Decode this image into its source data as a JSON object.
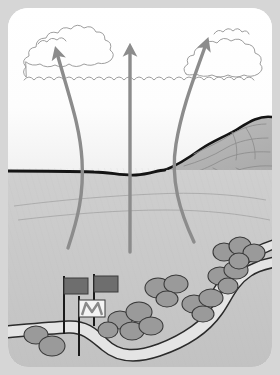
{
  "illustration": {
    "title": "Valley updraft and ridge landscape diagram",
    "frame": {
      "outer_background": "#d6d6d6",
      "frame_fill": "#ffffff",
      "corner_radius_px": 20
    },
    "palette": {
      "sky": "#fbfbfb",
      "sky_low": "#f0f0f0",
      "ground": "#c9c9c9",
      "ground_dark": "#bdbdbd",
      "mountain": "#b6b6b6",
      "mountain_shadow": "#a9a9a9",
      "horizon_line": "#1a1a1a",
      "arrow": "#8c8c8c",
      "cloud_outline": "#9a9a9a",
      "bush_fill": "#9a9a9a",
      "bush_outline": "#3a3a3a",
      "river_fill": "#e2e2e2",
      "river_outline": "#2b2b2b",
      "flag_dark": "#6e6e6e",
      "flag_white": "#f2f2f2",
      "pole": "#1a1a1a",
      "contour_line": "#8e8e8e"
    },
    "regions": [
      {
        "name": "sky",
        "label": "Sky"
      },
      {
        "name": "clouds",
        "label": "Cloud layer"
      },
      {
        "name": "mountain-ridge",
        "label": "Mountain ridge"
      },
      {
        "name": "valley-floor",
        "label": "Valley floor"
      },
      {
        "name": "river",
        "label": "River"
      }
    ],
    "clouds": [
      {
        "name": "cloud-left",
        "label": "Left cumulus cloud"
      },
      {
        "name": "cloud-center",
        "label": "Center cloud band"
      },
      {
        "name": "cloud-right",
        "label": "Right cumulus cloud"
      }
    ],
    "arrows": [
      {
        "name": "updraft-arrow-left",
        "label": "Left curved updraft",
        "shape": "curved"
      },
      {
        "name": "updraft-arrow-center",
        "label": "Center vertical updraft",
        "shape": "straight"
      },
      {
        "name": "updraft-arrow-right",
        "label": "Right curved updraft",
        "shape": "curved"
      }
    ],
    "flags": [
      {
        "name": "flag-dark-left",
        "label": "Dark flag (left)",
        "color": "#6e6e6e",
        "pattern": "solid"
      },
      {
        "name": "flag-dark-right",
        "label": "Dark flag (right)",
        "color": "#6e6e6e",
        "pattern": "solid"
      },
      {
        "name": "flag-white-chevron",
        "label": "White flag with chevron",
        "color": "#f2f2f2",
        "pattern": "chevron"
      }
    ],
    "bush_clusters": [
      {
        "name": "bush-cluster-bottom-left",
        "label": "Bush cluster bottom left",
        "count": 2
      },
      {
        "name": "bush-cluster-center",
        "label": "Bush cluster center",
        "count": 5
      },
      {
        "name": "bush-cluster-mid-right",
        "label": "Bush cluster mid right",
        "count": 3
      },
      {
        "name": "bush-cluster-riverbank",
        "label": "Bush cluster riverbank",
        "count": 3
      },
      {
        "name": "bush-cluster-upper-right",
        "label": "Bush cluster upper right",
        "count": 4
      },
      {
        "name": "bush-cluster-river-bend",
        "label": "Bush cluster river bend",
        "count": 3
      }
    ]
  }
}
